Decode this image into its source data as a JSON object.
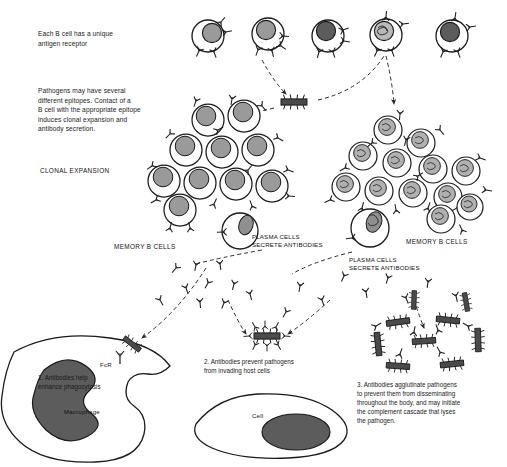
{
  "figure": {
    "title_absent": true,
    "background": "#ffffff",
    "ink": "#1a1a1a",
    "nucleus_gray": "#9a9a9a",
    "dark_fill": "#5c5c5c",
    "pathogen_fill": "#4a4a4a"
  },
  "captions": {
    "receptor": "Each B cell has a unique\nantigen receptor",
    "epitopes": "Pathogens may have several\ndifferent epitopes. Contact of a\nB cell with the appropriate epitope\ninduces clonal expansion and\nantibody secretion.",
    "clonal_expansion": "CLONAL EXPANSION",
    "memory_left": "MEMORY B CELLS",
    "memory_right": "MEMORY B CELLS",
    "plasma_left": "PLASMA CELLS\nSECRETE ANTIBODIES",
    "plasma_right": "PLASMA CELLS\nSECRETE ANTIBODIES",
    "step1": "1. Antibodies help\n    enhance phagocytosis",
    "fcr": "FcR",
    "macrophage": "Macrophage",
    "step2": "2. Antibodies prevent pathogens\n    from invading host cells",
    "cell": "Cell",
    "step3": "3. Antibodies agglutinate pathogens\nto prevent them from disseminating\nthroughout the body, and may initiate\nthe complement cascade that lyses\nthe pathogen."
  },
  "naive_b_cells": [
    {
      "id": 1,
      "cx": 208,
      "cy": 36,
      "r": 16,
      "nucleus": "gray"
    },
    {
      "id": 2,
      "cx": 268,
      "cy": 34,
      "r": 16,
      "nucleus": "gray"
    },
    {
      "id": 3,
      "cx": 328,
      "cy": 36,
      "r": 16,
      "nucleus": "dark"
    },
    {
      "id": 4,
      "cx": 386,
      "cy": 35,
      "r": 16,
      "nucleus": "scribble"
    },
    {
      "id": 5,
      "cx": 452,
      "cy": 36,
      "r": 16,
      "nucleus": "dark"
    }
  ],
  "clone_left": [
    {
      "cx": 208,
      "cy": 120,
      "r": 16
    },
    {
      "cx": 242,
      "cy": 115,
      "r": 16
    },
    {
      "cx": 186,
      "cy": 150,
      "r": 16
    },
    {
      "cx": 222,
      "cy": 152,
      "r": 16
    },
    {
      "cx": 258,
      "cy": 150,
      "r": 16
    },
    {
      "cx": 166,
      "cy": 180,
      "r": 16
    },
    {
      "cx": 200,
      "cy": 182,
      "r": 16
    },
    {
      "cx": 236,
      "cy": 183,
      "r": 16
    },
    {
      "cx": 270,
      "cy": 186,
      "r": 16
    },
    {
      "cx": 180,
      "cy": 208,
      "r": 16
    }
  ],
  "clone_right": [
    {
      "cx": 388,
      "cy": 130,
      "r": 14
    },
    {
      "cx": 420,
      "cy": 142,
      "r": 14
    },
    {
      "cx": 363,
      "cy": 155,
      "r": 14
    },
    {
      "cx": 396,
      "cy": 162,
      "r": 14
    },
    {
      "cx": 432,
      "cy": 168,
      "r": 14
    },
    {
      "cx": 464,
      "cy": 170,
      "r": 14
    },
    {
      "cx": 346,
      "cy": 186,
      "r": 14
    },
    {
      "cx": 378,
      "cy": 190,
      "r": 14
    },
    {
      "cx": 412,
      "cy": 192,
      "r": 14
    },
    {
      "cx": 447,
      "cy": 196,
      "r": 14
    },
    {
      "cx": 398,
      "cy": 220,
      "r": 17
    },
    {
      "cx": 440,
      "cy": 218,
      "r": 14
    },
    {
      "cx": 466,
      "cy": 206,
      "r": 14
    }
  ],
  "plasma_cells": [
    {
      "cx": 240,
      "cy": 231,
      "r": 18,
      "label": "plasma_left"
    },
    {
      "cx": 370,
      "cy": 228,
      "r": 19,
      "label": "plasma_right"
    }
  ],
  "pathogen_top": {
    "x": 276,
    "y": 98,
    "w": 36,
    "h": 8,
    "epitopes": 6
  },
  "pathogen_opsonized": {
    "cx": 267,
    "cy": 335
  },
  "agglutinated_cluster": {
    "cx": 432,
    "cy": 345,
    "rods": 9
  },
  "macrophage": {
    "cx": 85,
    "cy": 395
  },
  "host_cell": {
    "cx": 262,
    "cy": 424
  },
  "icons": {
    "antibody": "antibody-y-icon",
    "pathogen": "bacterium-rod-icon",
    "arrow": "dashed-arrow-icon"
  }
}
